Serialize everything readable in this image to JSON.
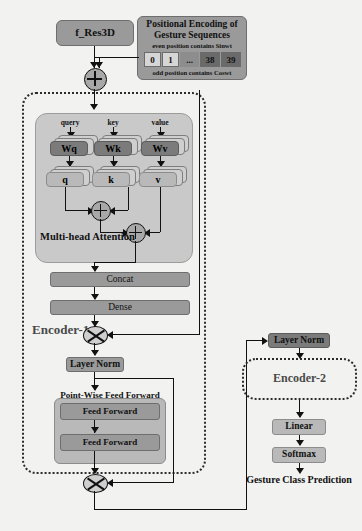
{
  "input": {
    "feature_box": "f_Res3D"
  },
  "positional_encoding": {
    "title_line1": "Positional Encoding of",
    "title_line2": "Gesture Sequences",
    "even_note": "even position contains Sinwt",
    "odd_note": "odd position contains Coswt",
    "cells": [
      "0",
      "1",
      "...",
      "38",
      "39"
    ]
  },
  "encoder1": {
    "label": "Encoder-1",
    "attention": {
      "title": "Multi-head Attention",
      "inputs": [
        "query",
        "key",
        "value"
      ],
      "weights": [
        "Wq",
        "Wk",
        "Wv"
      ],
      "projections": [
        "q",
        "k",
        "v"
      ]
    },
    "concat": "Concat",
    "dense": "Dense",
    "layer_norm": "Layer Norm",
    "ffn": {
      "title": "Point-Wise Feed Forward",
      "layers": [
        "Feed Forward",
        "Feed Forward"
      ]
    }
  },
  "encoder2": {
    "layer_norm": "Layer Norm",
    "label": "Encoder-2"
  },
  "head": {
    "linear": "Linear",
    "softmax": "Softmax",
    "output": "Gesture Class Prediction"
  },
  "operators": {
    "add": "plus-circle",
    "multiply": "cross-circle"
  },
  "colors": {
    "page_background": "#f2f2f0",
    "box_dark": "#7b7b7b",
    "box_mid": "#9a9a9a",
    "box_light": "#b9b9b9",
    "panel": "#c9c9c9",
    "stroke": "#111111"
  }
}
